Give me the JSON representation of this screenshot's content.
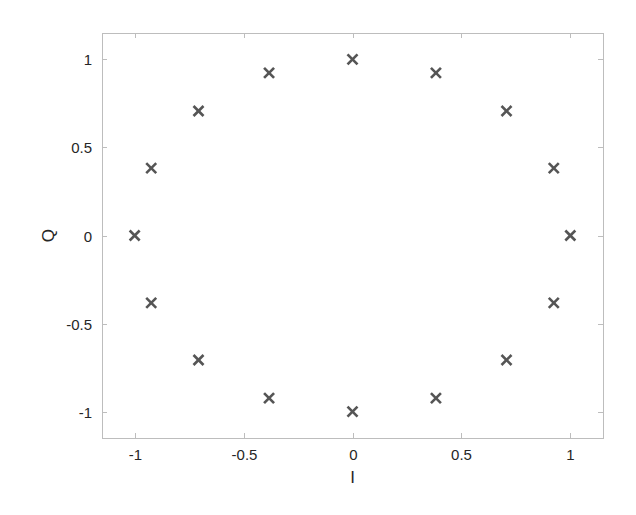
{
  "chart_data": {
    "type": "scatter",
    "title": "",
    "xlabel": "I",
    "ylabel": "Q",
    "xlim": [
      -1.15,
      1.15
    ],
    "ylim": [
      -1.15,
      1.15
    ],
    "grid": false,
    "legend": null,
    "marker": "x",
    "marker_color": "#555555",
    "xticks": [
      -1,
      -0.5,
      0,
      0.5,
      1
    ],
    "xtick_labels": [
      "-1",
      "-0.5",
      "0",
      "0.5",
      "1"
    ],
    "yticks": [
      -1,
      -0.5,
      0,
      0.5,
      1
    ],
    "ytick_labels": [
      "-1",
      "-0.5",
      "0",
      "0.5",
      "1"
    ],
    "series": [
      {
        "name": "constellation",
        "points": [
          {
            "x": 1.0,
            "y": 0.0
          },
          {
            "x": 0.924,
            "y": 0.383
          },
          {
            "x": 0.707,
            "y": 0.707
          },
          {
            "x": 0.383,
            "y": 0.924
          },
          {
            "x": 0.0,
            "y": 1.0
          },
          {
            "x": -0.383,
            "y": 0.924
          },
          {
            "x": -0.707,
            "y": 0.707
          },
          {
            "x": -0.924,
            "y": 0.383
          },
          {
            "x": -1.0,
            "y": 0.0
          },
          {
            "x": -0.924,
            "y": -0.383
          },
          {
            "x": -0.707,
            "y": -0.707
          },
          {
            "x": -0.383,
            "y": -0.924
          },
          {
            "x": 0.0,
            "y": -1.0
          },
          {
            "x": 0.383,
            "y": -0.924
          },
          {
            "x": 0.707,
            "y": -0.707
          },
          {
            "x": 0.924,
            "y": -0.383
          }
        ]
      }
    ]
  },
  "layout": {
    "plot_box": {
      "left": 102,
      "top": 33,
      "right": 603,
      "bottom": 438
    },
    "axis_color": "#bdbdbd",
    "text_color": "#262626"
  }
}
